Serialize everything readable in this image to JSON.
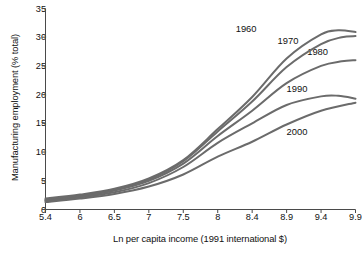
{
  "chart_data": {
    "type": "line",
    "title": "",
    "subtitle": "",
    "xlabel": "Ln per capita income (1991 international $)",
    "ylabel": "Manufacturing employment (% total)",
    "xticklabels": [
      "5.4",
      "6",
      "6.5",
      "7",
      "7.5",
      "8",
      "8.4",
      "8.9",
      "9.4",
      "9.9"
    ],
    "yticklabels": [
      "0",
      "5",
      "10",
      "15",
      "20",
      "25",
      "30",
      "35"
    ],
    "xlim": [
      5.4,
      9.9
    ],
    "ylim": [
      0,
      35
    ],
    "grid": false,
    "legend_position": "inline-curve-labels",
    "line_color": "#6b6b6b",
    "series": [
      {
        "name": "1960",
        "label_x": 8.33,
        "label_y": 31.6,
        "x": [
          5.4,
          6.0,
          6.5,
          7.0,
          7.5,
          8.0,
          8.4,
          8.9,
          9.4,
          9.65,
          9.9
        ],
        "values": [
          1.9,
          2.6,
          3.6,
          5.4,
          8.6,
          14.0,
          19.6,
          26.3,
          30.5,
          31.2,
          30.9
        ]
      },
      {
        "name": "1970",
        "label_x": 8.92,
        "label_y": 29.6,
        "x": [
          5.4,
          6.0,
          6.5,
          7.0,
          7.5,
          8.0,
          8.4,
          8.9,
          9.4,
          9.7,
          9.9
        ],
        "values": [
          1.7,
          2.4,
          3.4,
          5.2,
          8.4,
          13.6,
          18.8,
          24.8,
          28.8,
          30.0,
          30.2
        ]
      },
      {
        "name": "1980",
        "label_x": 9.35,
        "label_y": 27.6,
        "x": [
          5.4,
          6.0,
          6.5,
          7.0,
          7.5,
          8.0,
          8.4,
          8.9,
          9.4,
          9.7,
          9.9
        ],
        "values": [
          1.6,
          2.3,
          3.3,
          5.0,
          8.0,
          12.8,
          17.2,
          22.0,
          25.0,
          25.8,
          26.0
        ]
      },
      {
        "name": "1990",
        "label_x": 9.05,
        "label_y": 21.1,
        "x": [
          5.4,
          6.0,
          6.5,
          7.0,
          7.5,
          8.0,
          8.4,
          8.9,
          9.4,
          9.65,
          9.9
        ],
        "values": [
          1.5,
          2.1,
          3.0,
          4.6,
          7.4,
          11.6,
          15.0,
          18.2,
          19.7,
          19.8,
          19.3
        ]
      },
      {
        "name": "2000",
        "label_x": 9.05,
        "label_y": 13.6,
        "x": [
          5.4,
          6.0,
          6.5,
          7.0,
          7.5,
          8.0,
          8.4,
          8.9,
          9.4,
          9.9
        ],
        "values": [
          1.3,
          1.9,
          2.7,
          4.0,
          6.1,
          9.2,
          11.8,
          14.8,
          17.2,
          18.6
        ]
      }
    ]
  }
}
